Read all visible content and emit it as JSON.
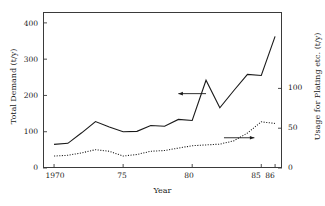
{
  "chart_data": {
    "type": "line",
    "title": "",
    "xlabel": "Year",
    "ylabel": "Total Demand (t/y)",
    "ylabel_right": "Usage for Plating etc. (t/y)",
    "xlim": [
      1969.2,
      1986.5
    ],
    "ylim": [
      0,
      430
    ],
    "ylim_right": [
      0,
      196
    ],
    "grid": false,
    "legend": "none",
    "xticks": [
      1970,
      1975,
      1980,
      1985,
      1986
    ],
    "xticklabels": [
      "1970",
      "75",
      "80",
      "85",
      "86"
    ],
    "yticks_left": [
      0,
      100,
      200,
      300,
      400
    ],
    "yticklabels_left": [
      "0",
      "100",
      "200",
      "300",
      "400"
    ],
    "yticks_right": [
      0,
      50,
      100
    ],
    "yticklabels_right": [
      "0",
      "50",
      "100"
    ],
    "x": [
      1970,
      1971,
      1972,
      1973,
      1974,
      1975,
      1976,
      1977,
      1978,
      1979,
      1980,
      1981,
      1982,
      1983,
      1984,
      1985,
      1986
    ],
    "series": [
      {
        "name": "Total Demand",
        "axis": "left",
        "style": "solid",
        "color": "#1a1a1a",
        "values": [
          65,
          68,
          97,
          128,
          113,
          100,
          101,
          117,
          115,
          134,
          131,
          242,
          166,
          213,
          258,
          255,
          363
        ]
      },
      {
        "name": "Usage for Plating etc.",
        "axis": "right",
        "style": "dotted",
        "color": "#1a1a1a",
        "values": [
          15,
          16,
          19,
          23,
          21,
          15,
          17,
          21,
          22,
          25,
          28,
          29,
          30,
          34,
          44,
          58,
          56
        ]
      }
    ],
    "annotations": [
      {
        "name": "left-axis-arrow",
        "direction": "left",
        "points_to": "Total Demand",
        "x_start": 1981.0,
        "x_end": 1979.0,
        "y_value": 205
      },
      {
        "name": "right-axis-arrow",
        "direction": "right",
        "points_to": "Usage for Plating etc.",
        "x_start": 1982.3,
        "x_end": 1984.5,
        "y_value": 38
      }
    ]
  }
}
